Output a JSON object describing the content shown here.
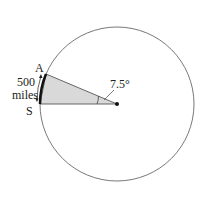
{
  "diagram": {
    "points": {
      "a_label": "A",
      "s_label": "S"
    },
    "arc_length": {
      "value": "500",
      "unit": "miles"
    },
    "angle_label": "7.5°",
    "colors": {
      "circle_stroke": "#555555",
      "sector_fill": "#d9d9d9",
      "arc_stroke": "#111111",
      "center_dot": "#111111"
    }
  }
}
